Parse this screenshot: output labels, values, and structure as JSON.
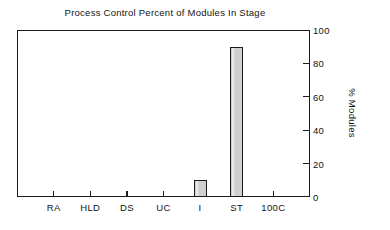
{
  "chart_data": {
    "type": "bar",
    "title": "Process Control Percent of Modules In Stage",
    "xlabel": "",
    "ylabel": "% Modules",
    "categories": [
      "RA",
      "HLD",
      "DS",
      "UC",
      "I",
      "ST",
      "100C"
    ],
    "values": [
      0,
      0,
      0,
      0,
      10,
      90,
      0
    ],
    "ylim": [
      0,
      100
    ],
    "yticks": [
      0,
      20,
      40,
      60,
      80,
      100
    ],
    "ytick_labels": [
      "0",
      "20",
      "40",
      "60",
      "80",
      "100"
    ],
    "y_axis_position": "right",
    "grid": false,
    "legend": null,
    "bar_fill_color": "#cfcfcf",
    "bar_edge_color": "#1b1b1b",
    "frame_color": "#1c1c1c",
    "background_color": "#ffffff"
  }
}
